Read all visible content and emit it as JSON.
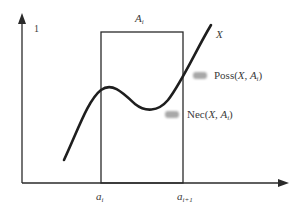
{
  "diagram": {
    "type": "possibility-necessity-illustration",
    "y_axis": {
      "top_label": "1"
    },
    "x_axis": {
      "ticks": [
        {
          "base": "a",
          "sub": "i"
        },
        {
          "base": "a",
          "sub": "i+1"
        }
      ]
    },
    "interval": {
      "base": "A",
      "sub": "i"
    },
    "curve": {
      "label": "X"
    },
    "annotations": [
      {
        "id": "poss",
        "prefix": "Poss(",
        "args": "X, ",
        "set_base": "A",
        "set_sub": "i",
        "suffix": ")"
      },
      {
        "id": "nec",
        "prefix": "Nec(",
        "args": "X, ",
        "set_base": "A",
        "set_sub": "i",
        "suffix": ")"
      }
    ],
    "colors": {
      "line": "#2a2a2a",
      "pointer": "#a8a8a8",
      "text": "#3a3a3a"
    }
  }
}
